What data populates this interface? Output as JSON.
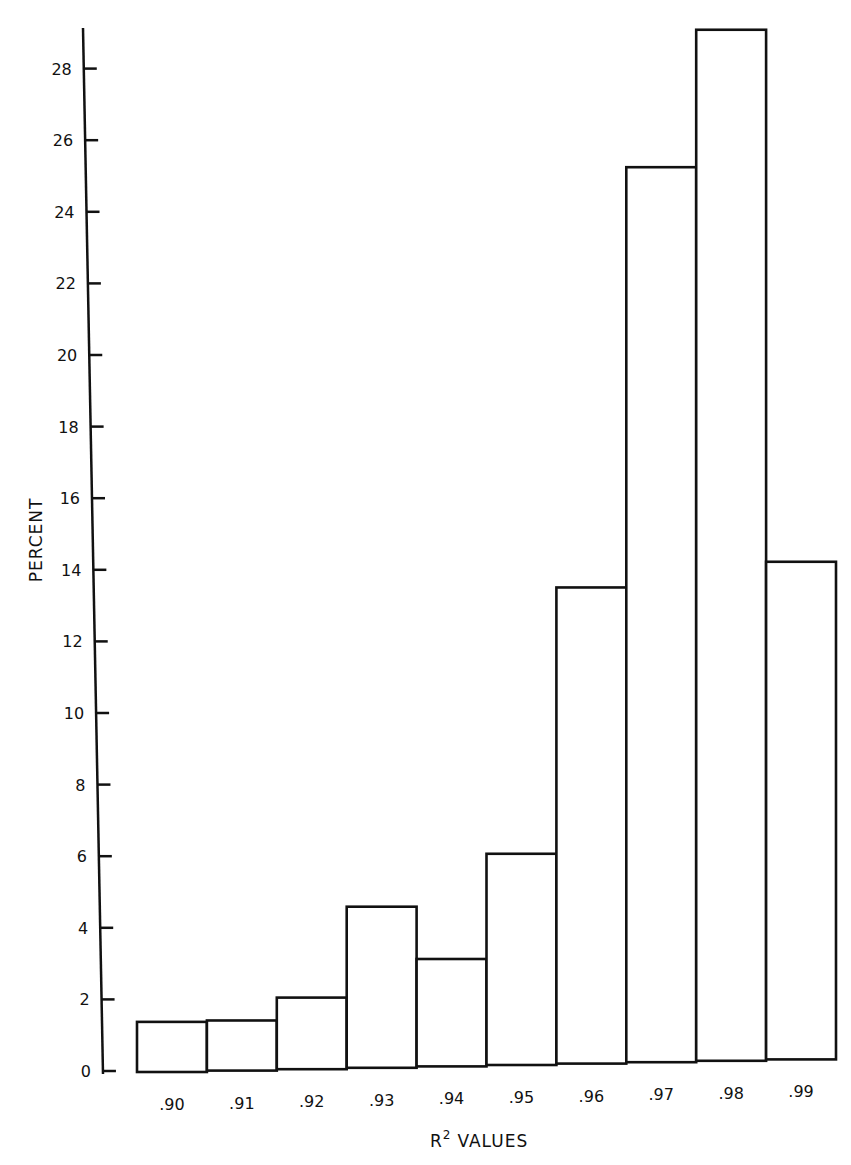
{
  "chart_data": {
    "type": "bar",
    "title": "",
    "xlabel": "R2 VALUES",
    "xlabel_base": "R",
    "xlabel_sup": "2",
    "xlabel_rest": "VALUES",
    "ylabel": "PERCENT",
    "categories": [
      ".90",
      ".91",
      ".92",
      ".93",
      ".94",
      ".95",
      ".96",
      ".97",
      ".98",
      ".99"
    ],
    "values": [
      1.4,
      1.4,
      2.0,
      4.5,
      3.0,
      5.9,
      13.3,
      25.0,
      28.8,
      13.9
    ],
    "yticks": [
      0,
      2,
      4,
      6,
      8,
      10,
      12,
      14,
      16,
      18,
      20,
      22,
      24,
      26,
      28
    ],
    "ylim": [
      0,
      29.5
    ],
    "grid": false,
    "legend": null,
    "bar_fill": "#ffffff",
    "bar_stroke": "#111111"
  }
}
